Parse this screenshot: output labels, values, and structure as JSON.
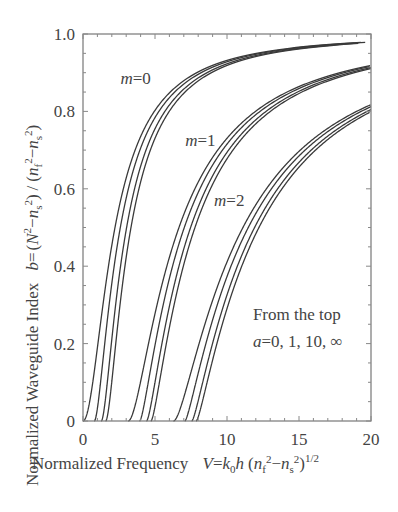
{
  "chart_data": {
    "type": "line",
    "title": "",
    "xlabel": "Normalized Frequency  V = k0h (nf^2 - ns^2)^1/2",
    "xlabel_parts": {
      "text": "Normalized Frequency",
      "formula": "V = k0h (nf² − ns²)^1/2"
    },
    "ylabel": "Normalized Waveguide Index  b = (N^2 - ns^2) / (nf^2 - ns^2)",
    "ylabel_parts": {
      "text": "Normalized Waveguide Index",
      "formula": "b = (N² − ns²) / (nf² − ns²)"
    },
    "xlim": [
      0,
      20
    ],
    "ylim": [
      0,
      1.0
    ],
    "xticks": [
      0,
      5,
      10,
      15,
      20
    ],
    "xtick_labels": [
      "0",
      "5",
      "10",
      "15",
      "20"
    ],
    "yticks": [
      0,
      0.2,
      0.4,
      0.6,
      0.8,
      1.0
    ],
    "ytick_labels": [
      "0",
      "0.2",
      "0.4",
      "0.6",
      "0.8",
      "1.0"
    ],
    "grid": false,
    "legend": null,
    "asymmetry_values": [
      0,
      1,
      10,
      "inf"
    ],
    "mode_labels": [
      {
        "text": "m=0",
        "m": 0,
        "x": 2.6,
        "y": 0.87
      },
      {
        "text": "m=1",
        "m": 1,
        "x": 7.1,
        "y": 0.71
      },
      {
        "text": "m=2",
        "m": 2,
        "x": 9.1,
        "y": 0.555
      }
    ],
    "annotation": {
      "line1": "From the top",
      "line2": "a=0, 1, 10, ∞",
      "x": 11.8,
      "y": 0.26
    },
    "x": [
      0,
      1,
      2,
      3,
      4,
      5,
      6,
      7,
      8,
      10,
      12,
      15,
      20
    ],
    "series": [
      {
        "name": "m=0, a=0",
        "cutoff": 0.0,
        "values": [
          0,
          0.35,
          0.65,
          0.78,
          0.85,
          0.89,
          0.92,
          0.93,
          0.95,
          0.96,
          0.97,
          0.98,
          0.99
        ]
      },
      {
        "name": "m=0, a=1",
        "cutoff": 0.79,
        "values": [
          null,
          0.07,
          0.49,
          0.69,
          0.79,
          0.85,
          0.89,
          0.91,
          0.93,
          0.95,
          0.96,
          0.97,
          0.98
        ]
      },
      {
        "name": "m=0, a=10",
        "cutoff": 1.26,
        "values": [
          null,
          null,
          0.32,
          0.6,
          0.74,
          0.82,
          0.87,
          0.9,
          0.92,
          0.94,
          0.96,
          0.97,
          0.98
        ]
      },
      {
        "name": "m=0, a=inf",
        "cutoff": 1.57,
        "values": [
          null,
          null,
          0.22,
          0.56,
          0.72,
          0.81,
          0.86,
          0.89,
          0.92,
          0.94,
          0.96,
          0.97,
          0.98
        ]
      },
      {
        "name": "m=1, a=0",
        "cutoff": 3.14,
        "values": [
          null,
          null,
          null,
          null,
          0.18,
          0.38,
          0.52,
          0.62,
          0.69,
          0.78,
          0.84,
          0.89,
          0.93
        ]
      },
      {
        "name": "m=1, a=1",
        "cutoff": 3.93,
        "values": [
          null,
          null,
          null,
          null,
          0.01,
          0.22,
          0.4,
          0.53,
          0.62,
          0.74,
          0.81,
          0.87,
          0.92
        ]
      },
      {
        "name": "m=1, a=10",
        "cutoff": 4.41,
        "values": [
          null,
          null,
          null,
          null,
          null,
          0.12,
          0.33,
          0.48,
          0.58,
          0.71,
          0.79,
          0.86,
          0.91
        ]
      },
      {
        "name": "m=1, a=inf",
        "cutoff": 4.71,
        "values": [
          null,
          null,
          null,
          null,
          null,
          0.06,
          0.29,
          0.45,
          0.56,
          0.7,
          0.78,
          0.86,
          0.91
        ]
      },
      {
        "name": "m=2, a=0",
        "cutoff": 6.28,
        "values": [
          null,
          null,
          null,
          null,
          null,
          null,
          null,
          0.1,
          0.27,
          0.48,
          0.62,
          0.74,
          0.84
        ]
      },
      {
        "name": "m=2, a=1",
        "cutoff": 7.07,
        "values": [
          null,
          null,
          null,
          null,
          null,
          null,
          null,
          null,
          0.12,
          0.38,
          0.55,
          0.7,
          0.81
        ]
      },
      {
        "name": "m=2, a=10",
        "cutoff": 7.55,
        "values": [
          null,
          null,
          null,
          null,
          null,
          null,
          null,
          null,
          0.05,
          0.33,
          0.51,
          0.68,
          0.8
        ]
      },
      {
        "name": "m=2, a=inf",
        "cutoff": 7.85,
        "values": [
          null,
          null,
          null,
          null,
          null,
          null,
          null,
          null,
          0.01,
          0.3,
          0.49,
          0.66,
          0.8
        ]
      }
    ]
  },
  "layout": {
    "plot": {
      "left": 83,
      "top": 34,
      "right": 371,
      "bottom": 421
    },
    "line_color": "#3a3a3a",
    "axis_color": "#777777"
  }
}
